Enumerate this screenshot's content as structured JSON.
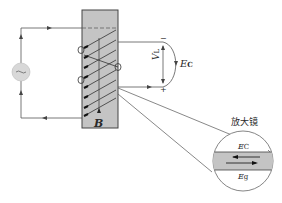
{
  "diagram": {
    "colors": {
      "line": "#555555",
      "block_fill": "#c4c4c4",
      "block_stroke": "#444444",
      "source_fill": "#d8d8d8",
      "text": "#2a2a2a"
    },
    "labels": {
      "magnetic_field": "B",
      "voltage": "V",
      "voltage_sub": "L",
      "emf": "E",
      "emf_sub": "C",
      "magnifier_title": "放大镜",
      "magnifier_top": "E",
      "magnifier_top_sub": "C",
      "magnifier_bottom": "E",
      "magnifier_bottom_sub": "g",
      "minus_sign": "−",
      "plus_sign": "+",
      "source_symbol": "~"
    }
  }
}
